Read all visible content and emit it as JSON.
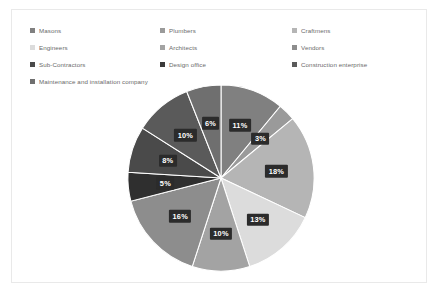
{
  "panel": {
    "background": "#ffffff",
    "border_color": "#e9e9e9"
  },
  "legend": {
    "rows": [
      [
        {
          "label": "Masons",
          "color": "#808080"
        },
        {
          "label": "Plumbers",
          "color": "#9a9a9a"
        },
        {
          "label": "Craftmens",
          "color": "#b5b5b5"
        }
      ],
      [
        {
          "label": "Engineers",
          "color": "#dcdcdc"
        },
        {
          "label": "Architects",
          "color": "#a3a3a3"
        },
        {
          "label": "Vendors",
          "color": "#8d8d8d"
        }
      ],
      [
        {
          "label": "Sub-Contractors",
          "color": "#4a4a4a"
        },
        {
          "label": "Design office",
          "color": "#3a3a3a"
        },
        {
          "label": "Construction enterprise",
          "color": "#5a5a5a"
        }
      ],
      [
        {
          "label": "Maintenance and installation company",
          "color": "#6f6f6f"
        }
      ]
    ]
  },
  "chart_data": {
    "type": "pie",
    "title": "",
    "legend_position": "top",
    "start_angle_deg": 0,
    "direction": "clockwise",
    "categories": [
      "Masons",
      "Plumbers",
      "Craftmens",
      "Engineers",
      "Architects",
      "Vendors",
      "Sub-Contractors",
      "Design office",
      "Construction enterprise",
      "Maintenance and installation company"
    ],
    "values": [
      11,
      3,
      18,
      13,
      10,
      16,
      5,
      8,
      10,
      6
    ],
    "labels": [
      "11%",
      "3%",
      "18%",
      "13%",
      "10%",
      "16%",
      "5%",
      "8%",
      "10%",
      "6%"
    ],
    "colors": [
      "#808080",
      "#9a9a9a",
      "#b5b5b5",
      "#dcdcdc",
      "#a3a3a3",
      "#8d8d8d",
      "#2f2f2f",
      "#4a4a4a",
      "#5a5a5a",
      "#6f6f6f"
    ],
    "total": 100,
    "label_style": {
      "background": "#2b2b2b",
      "text_color": "#ffffff"
    }
  }
}
